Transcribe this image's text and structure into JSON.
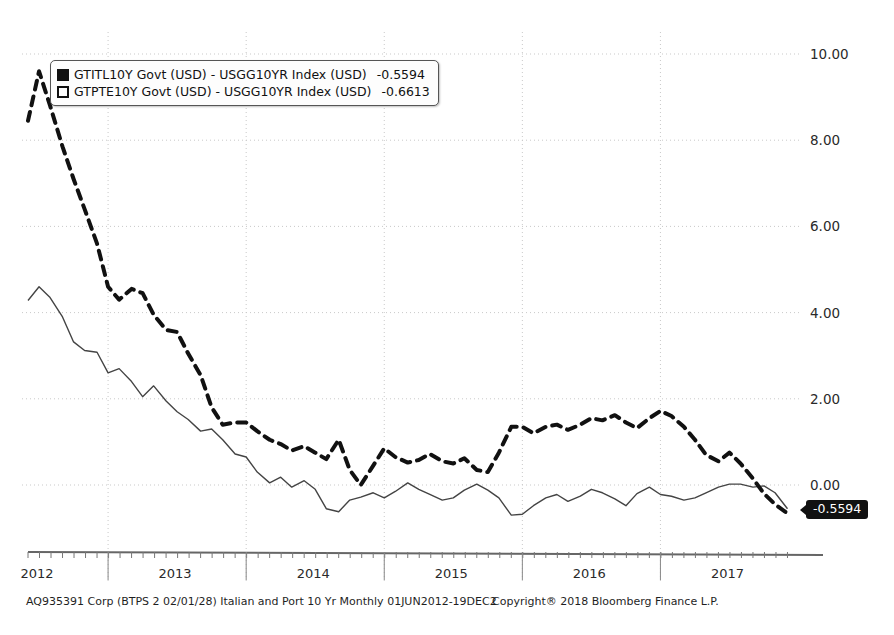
{
  "chart_data": {
    "type": "line",
    "title": "",
    "subtitle": "",
    "xlabel": "",
    "ylabel": "",
    "grid": true,
    "legend_position": "top-left",
    "xlim": [
      2012.42,
      2017.96
    ],
    "ylim": [
      -1.6,
      10.9
    ],
    "y_ticks": [
      "10.00",
      "8.00",
      "6.00",
      "4.00",
      "2.00",
      "0.00"
    ],
    "y_tick_values": [
      10,
      8,
      6,
      4,
      2,
      0
    ],
    "x_ticks": [
      "2012",
      "2013",
      "2014",
      "2015",
      "2016",
      "2017"
    ],
    "x_tick_values": [
      2012,
      2013,
      2014,
      2015,
      2016,
      2017
    ],
    "x_axis_note": "Monthly observations 01JUN2012 - 19DEC2017",
    "series": [
      {
        "name": "GTITL10Y Govt (USD) - USGG10YR Index (USD)",
        "style": "solid",
        "color": "#444444",
        "last_value": -0.5594,
        "x": [
          2012.42,
          2012.5,
          2012.58,
          2012.67,
          2012.75,
          2012.83,
          2012.92,
          2013.0,
          2013.08,
          2013.17,
          2013.25,
          2013.33,
          2013.42,
          2013.5,
          2013.58,
          2013.67,
          2013.75,
          2013.83,
          2013.92,
          2014.0,
          2014.08,
          2014.17,
          2014.25,
          2014.33,
          2014.42,
          2014.5,
          2014.58,
          2014.67,
          2014.75,
          2014.83,
          2014.92,
          2015.0,
          2015.08,
          2015.17,
          2015.25,
          2015.33,
          2015.42,
          2015.5,
          2015.58,
          2015.67,
          2015.75,
          2015.83,
          2015.92,
          2016.0,
          2016.08,
          2016.17,
          2016.25,
          2016.33,
          2016.42,
          2016.5,
          2016.58,
          2016.67,
          2016.75,
          2016.83,
          2016.92,
          2017.0,
          2017.08,
          2017.17,
          2017.25,
          2017.33,
          2017.42,
          2017.5,
          2017.58,
          2017.67,
          2017.75,
          2017.83,
          2017.92
        ],
        "y": [
          4.28,
          4.6,
          4.35,
          3.9,
          3.32,
          3.12,
          3.08,
          2.6,
          2.7,
          2.4,
          2.05,
          2.3,
          1.95,
          1.7,
          1.52,
          1.25,
          1.3,
          1.05,
          0.72,
          0.65,
          0.3,
          0.05,
          0.18,
          -0.05,
          0.1,
          -0.1,
          -0.55,
          -0.62,
          -0.35,
          -0.28,
          -0.18,
          -0.3,
          -0.15,
          0.05,
          -0.1,
          -0.22,
          -0.35,
          -0.3,
          -0.12,
          0.02,
          -0.12,
          -0.3,
          -0.7,
          -0.68,
          -0.48,
          -0.3,
          -0.22,
          -0.38,
          -0.26,
          -0.1,
          -0.18,
          -0.32,
          -0.48,
          -0.2,
          -0.05,
          -0.22,
          -0.26,
          -0.35,
          -0.3,
          -0.18,
          -0.05,
          0.02,
          0.02,
          -0.05,
          -0.02,
          -0.18,
          -0.55
        ]
      },
      {
        "name": "GTPTE10Y Govt (USD) - USGG10YR Index (USD)",
        "style": "dashed",
        "color": "#111111",
        "last_value": -0.6613,
        "x": [
          2012.42,
          2012.5,
          2012.58,
          2012.67,
          2012.75,
          2012.83,
          2012.92,
          2013.0,
          2013.08,
          2013.17,
          2013.25,
          2013.33,
          2013.42,
          2013.5,
          2013.58,
          2013.67,
          2013.75,
          2013.83,
          2013.92,
          2014.0,
          2014.08,
          2014.17,
          2014.25,
          2014.33,
          2014.42,
          2014.5,
          2014.58,
          2014.67,
          2014.75,
          2014.83,
          2014.92,
          2015.0,
          2015.08,
          2015.17,
          2015.25,
          2015.33,
          2015.42,
          2015.5,
          2015.58,
          2015.67,
          2015.75,
          2015.83,
          2015.92,
          2016.0,
          2016.08,
          2016.17,
          2016.25,
          2016.33,
          2016.42,
          2016.5,
          2016.58,
          2016.67,
          2016.75,
          2016.83,
          2016.92,
          2017.0,
          2017.08,
          2017.17,
          2017.25,
          2017.33,
          2017.42,
          2017.5,
          2017.58,
          2017.67,
          2017.75,
          2017.83,
          2017.92
        ],
        "y": [
          8.45,
          9.6,
          8.8,
          7.85,
          7.1,
          6.4,
          5.6,
          4.6,
          4.3,
          4.55,
          4.45,
          3.95,
          3.6,
          3.55,
          3.05,
          2.55,
          1.8,
          1.4,
          1.45,
          1.45,
          1.25,
          1.05,
          0.95,
          0.8,
          0.9,
          0.75,
          0.6,
          1.05,
          0.35,
          0.0,
          0.45,
          0.85,
          0.65,
          0.52,
          0.58,
          0.72,
          0.55,
          0.5,
          0.62,
          0.35,
          0.3,
          0.75,
          1.35,
          1.35,
          1.2,
          1.35,
          1.4,
          1.28,
          1.4,
          1.55,
          1.5,
          1.62,
          1.45,
          1.32,
          1.55,
          1.72,
          1.6,
          1.35,
          1.05,
          0.7,
          0.55,
          0.75,
          0.5,
          0.15,
          -0.2,
          -0.45,
          -0.66
        ]
      }
    ]
  },
  "legend": {
    "rows": [
      {
        "marker": "filled-square",
        "label": "GTITL10Y Govt (USD) - USGG10YR Index (USD)",
        "value": "-0.5594"
      },
      {
        "marker": "dashed-square",
        "label": "GTPTE10Y Govt (USD) - USGG10YR Index (USD)",
        "value": "-0.6613"
      }
    ]
  },
  "callout": {
    "value": "-0.5594"
  },
  "footer": {
    "left": "AQ935391 Corp (BTPS 2 02/01/28) Italian and Port 10 Yr  Monthly 01JUN2012-19DEC2",
    "right": "Copyright® 2018 Bloomberg Finance L.P."
  },
  "colors": {
    "grid": "#c9c9c9",
    "axis": "#555555",
    "solid_series": "#444444",
    "dashed_series": "#111111",
    "badge_bg": "#111111",
    "badge_text": "#ffffff"
  }
}
